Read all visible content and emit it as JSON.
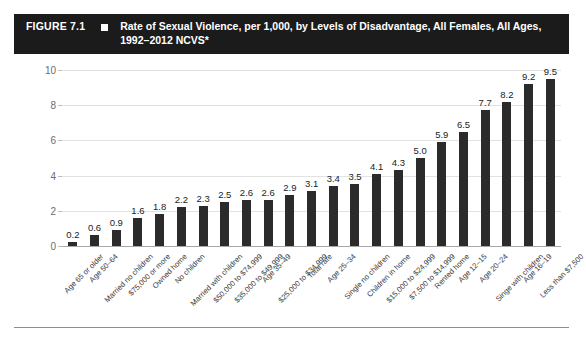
{
  "header": {
    "figure_number": "FIGURE 7.1",
    "bullet_icon": "square-bullet-icon",
    "title": "Rate of Sexual Violence, per 1,000, by Levels of Disadvantage, All Females, All Ages, 1992–2012 NCVS*"
  },
  "colors": {
    "header_background": "#1b1b1b",
    "header_text": "#ffffff",
    "bar": "#2b2b2b",
    "gridline": "#e2e2e2",
    "axis_text": "#6d6d6d",
    "category_text": "#3a3a3a",
    "page_background": "#ffffff"
  },
  "chart_data": {
    "type": "bar",
    "title": "Rate of Sexual Violence, per 1,000, by Levels of Disadvantage, All Females, All Ages, 1992–2012 NCVS*",
    "xlabel": "",
    "ylabel": "",
    "ylim": [
      0,
      10
    ],
    "yticks": [
      0,
      2,
      4,
      6,
      8,
      10
    ],
    "ytick_labels": [
      "0",
      "2",
      "4",
      "6",
      "8",
      "10"
    ],
    "grid": true,
    "legend": false,
    "categories": [
      "Age 65 or older",
      "Age 50–64",
      "Married no children",
      "$75,000 or more",
      "Owned home",
      "No children",
      "Married with children",
      "$50,000 to $74,999",
      "$35,000 to $49,999",
      "Age 35–49",
      "$25,000 to $34,999",
      "Total rate",
      "Age 25–34",
      "Single no children",
      "Children in home",
      "$15,000 to $24,999",
      "$7,500 to $14,999",
      "Rented home",
      "Age 12–15",
      "Age 20–24",
      "Singe with children",
      "Age 16–19",
      "Less than $7,500"
    ],
    "values": [
      0.2,
      0.6,
      0.9,
      1.6,
      1.8,
      2.2,
      2.3,
      2.5,
      2.6,
      2.6,
      2.9,
      3.1,
      3.4,
      3.5,
      4.1,
      4.3,
      5.0,
      5.9,
      6.5,
      7.7,
      8.2,
      9.2,
      9.5
    ],
    "value_labels": [
      "0.2",
      "0.6",
      "0.9",
      "1.6",
      "1.8",
      "2.2",
      "2.3",
      "2.5",
      "2.6",
      "2.6",
      "2.9",
      "3.1",
      "3.4",
      "3.5",
      "4.1",
      "4.3",
      "5.0",
      "5.9",
      "6.5",
      "7.7",
      "8.2",
      "9.2",
      "9.5"
    ]
  }
}
